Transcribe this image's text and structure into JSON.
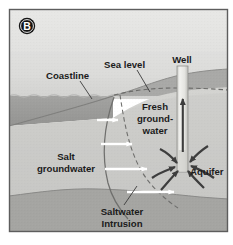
{
  "figure": {
    "panel_letter": "B",
    "title_alt": "Saltwater intrusion into a coastal aquifer",
    "frame_border_color": "#5d5d5d",
    "background_color": "#ffffff"
  },
  "labels": {
    "coastline": "Coastline",
    "sea_level": "Sea level",
    "well": "Well",
    "fresh_groundwater_line1": "Fresh",
    "fresh_groundwater_line2": "ground-",
    "fresh_groundwater_line3": "water",
    "salt_groundwater_line1": "Salt",
    "salt_groundwater_line2": "groundwater",
    "aquifer": "Aquifer",
    "saltwater_intrusion_line1": "Saltwater",
    "saltwater_intrusion_line2": "Intrusion"
  },
  "colors": {
    "sky": "#e4e4e2",
    "sky_low": "#d8d8d6",
    "sea_water": "#9d9d9b",
    "land_surface": "#a9a9a7",
    "aquifer_fill": "#cfcfcc",
    "saturated_zone": "#c2c2bf",
    "bedrock": "#a5a5a2",
    "well_pipe": "#e9e9e6",
    "arrow_white": "#ffffff",
    "arrow_dark": "#3d3d3d",
    "interface_line": "#6a6a68",
    "water_table_dash": "#6a6a68",
    "text": "#1b1b1b",
    "panel_badge": "#141414"
  },
  "features": {
    "sea_level_elevation_px": 96,
    "coastline_x_px": 110,
    "bedrock_top_px": 190,
    "white_arrow_count": 4,
    "white_arrow_direction": "right (landward saltwater flow)",
    "dark_arrow_direction": "converging upward into well (fresh groundwater pumping)",
    "water_table_style": "dashed"
  }
}
